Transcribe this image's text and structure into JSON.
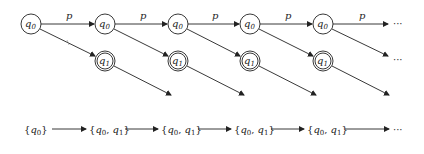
{
  "diagram": {
    "type": "automaton-unfolding",
    "top_row": {
      "nodes": [
        {
          "id": "q0_0",
          "label": "q",
          "sub": "0",
          "cx": 31,
          "accepting": false
        },
        {
          "id": "q0_1",
          "label": "q",
          "sub": "0",
          "cx": 105,
          "accepting": false
        },
        {
          "id": "q0_2",
          "label": "q",
          "sub": "0",
          "cx": 178,
          "accepting": false
        },
        {
          "id": "q0_3",
          "label": "q",
          "sub": "0",
          "cx": 250,
          "accepting": false
        },
        {
          "id": "q0_4",
          "label": "q",
          "sub": "0",
          "cx": 323,
          "accepting": false
        }
      ],
      "edge_label": "p",
      "ellipsis": "···"
    },
    "middle_row": {
      "nodes": [
        {
          "id": "q1_1",
          "label": "q",
          "sub": "1",
          "cx": 105,
          "accepting": true
        },
        {
          "id": "q1_2",
          "label": "q",
          "sub": "1",
          "cx": 178,
          "accepting": true
        },
        {
          "id": "q1_3",
          "label": "q",
          "sub": "1",
          "cx": 250,
          "accepting": true
        },
        {
          "id": "q1_4",
          "label": "q",
          "sub": "1",
          "cx": 323,
          "accepting": true
        }
      ],
      "ellipsis": "···"
    },
    "bottom_row": {
      "sets": [
        "{q0}",
        "{q0, q1}",
        "{q0, q1}",
        "{q0, q1}",
        "{q0, q1}"
      ],
      "ellipsis": "···"
    }
  }
}
